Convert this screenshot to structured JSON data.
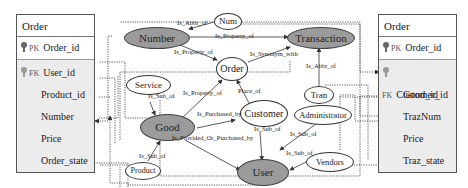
{
  "tables": {
    "left": {
      "title": "Order",
      "pk": {
        "tag": "PK",
        "field": "Order_id"
      },
      "fk": {
        "tag": "FK",
        "field": "User_id"
      },
      "fields": [
        "Product_id",
        "Number",
        "Price",
        "Order_state"
      ]
    },
    "right": {
      "title": "Order",
      "pk": {
        "tag": "PK",
        "field": "Order_id"
      },
      "fk": {
        "tag": "FK",
        "field": "Customer_id"
      },
      "fields": [
        "Good_id",
        "TrazNum",
        "Price",
        "Traz_state"
      ]
    }
  },
  "nodes": {
    "number": "Number",
    "num": "Num",
    "transaction": "Transaction",
    "order": "Order",
    "service": "Service",
    "good": "Good",
    "customer": "Customer",
    "tran": "Tran",
    "administrator": "Administrator",
    "product": "Product",
    "user": "User",
    "vendors": "Vendors"
  },
  "edges": {
    "num_number": "Is_Abbr_of",
    "number_transaction": "Is_Property_of",
    "number_order": "Is_Property_of",
    "order_transaction": "Is_Synonym_with",
    "tran_transaction": "Is_Abbr_of",
    "service_good": "Is_Sub_of",
    "good_order": "Is_Property_of",
    "customer_order": "Place_of",
    "good_customer": "Is_Purchased_by",
    "product_good": "Is_Sub_of",
    "good_user": "Is_Provided_Or_Purchased_by",
    "customer_user": "Is_Sub_of",
    "administrator_user": "Is_Sub_of",
    "vendors_user": "Is_Sub_of"
  },
  "colors": {
    "highlight_node": "#9b9b9b",
    "table_body": "#ececec",
    "line": "#333333"
  }
}
